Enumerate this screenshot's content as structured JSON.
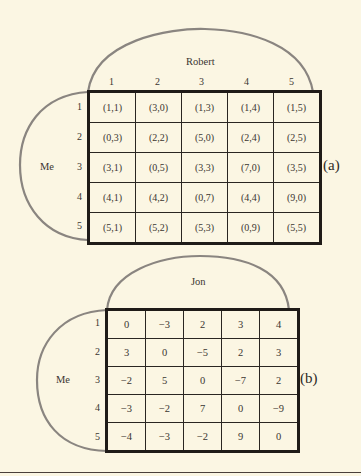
{
  "figure_a": {
    "tag": "(a)",
    "column_player": "Robert",
    "row_player": "Me",
    "column_labels": [
      "1",
      "2",
      "3",
      "4",
      "5"
    ],
    "row_labels": [
      "1",
      "2",
      "3",
      "4",
      "5"
    ],
    "cells": [
      [
        "(1,1)",
        "(3,0)",
        "(1,3)",
        "(1,4)",
        "(1,5)"
      ],
      [
        "(0,3)",
        "(2,2)",
        "(5,0)",
        "(2,4)",
        "(2,5)"
      ],
      [
        "(3,1)",
        "(0,5)",
        "(3,3)",
        "(7,0)",
        "(3,5)"
      ],
      [
        "(4,1)",
        "(4,2)",
        "(0,7)",
        "(4,4)",
        "(9,0)"
      ],
      [
        "(5,1)",
        "(5,2)",
        "(5,3)",
        "(0,9)",
        "(5,5)"
      ]
    ]
  },
  "figure_b": {
    "tag": "(b)",
    "column_player": "Jon",
    "row_player": "Me",
    "row_labels": [
      "1",
      "2",
      "3",
      "4",
      "5"
    ],
    "cells": [
      [
        "0",
        "−3",
        "2",
        "3",
        "4"
      ],
      [
        "3",
        "0",
        "−5",
        "2",
        "3"
      ],
      [
        "−2",
        "5",
        "0",
        "−7",
        "2"
      ],
      [
        "−3",
        "−2",
        "7",
        "0",
        "−9"
      ],
      [
        "−4",
        "−3",
        "−2",
        "9",
        "0"
      ]
    ]
  },
  "colors": {
    "background": "#fbf6e3",
    "grid": "#1f1b18",
    "arc": "#8a8580"
  }
}
